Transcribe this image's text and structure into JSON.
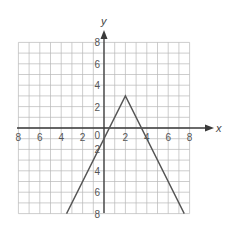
{
  "chart_data": {
    "type": "line",
    "title": "",
    "xlabel": "x",
    "ylabel": "y",
    "xlim": [
      -8,
      8
    ],
    "ylim": [
      -8,
      8
    ],
    "grid": true,
    "x_ticks": [
      "-8",
      "-6",
      "-4",
      "-2",
      "2",
      "4",
      "6",
      "8"
    ],
    "y_ticks": [
      "8",
      "6",
      "4",
      "2",
      "-2",
      "-4",
      "-6",
      "-8"
    ],
    "origin_label": "0",
    "series": [
      {
        "name": "absolute value function",
        "points": [
          [
            -3.5,
            -8
          ],
          [
            2,
            3
          ],
          [
            7.5,
            -8
          ]
        ],
        "vertex": [
          2,
          3
        ]
      }
    ]
  },
  "labels": {
    "x_axis": "x",
    "y_axis": "y",
    "origin": "0",
    "x_tick_labels": [
      "8",
      "6",
      "4",
      "2",
      "2",
      "4",
      "6",
      "8"
    ],
    "y_tick_labels": [
      "8",
      "6",
      "4",
      "2",
      "2",
      "4",
      "6",
      "8"
    ]
  }
}
